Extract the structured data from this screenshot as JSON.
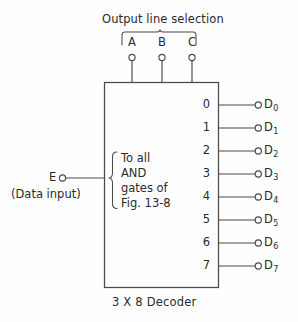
{
  "figure": {
    "caption": "3 X 8 Decoder",
    "top_label": "Output line selection",
    "select_inputs": [
      {
        "label": "A",
        "x": 132
      },
      {
        "label": "B",
        "x": 162
      },
      {
        "label": "C",
        "x": 192
      }
    ],
    "enable_input": {
      "label": "E",
      "sublabel": "(Data input)"
    },
    "inner_note_lines": [
      "To all",
      "AND",
      "gates of",
      "Fig. 13-8"
    ],
    "outputs": [
      {
        "pin": "0",
        "name": "D",
        "sub": "0",
        "y": 105
      },
      {
        "pin": "1",
        "name": "D",
        "sub": "1",
        "y": 128
      },
      {
        "pin": "2",
        "name": "D",
        "sub": "2",
        "y": 151
      },
      {
        "pin": "3",
        "name": "D",
        "sub": "3",
        "y": 174
      },
      {
        "pin": "4",
        "name": "D",
        "sub": "4",
        "y": 197
      },
      {
        "pin": "5",
        "name": "D",
        "sub": "5",
        "y": 220
      },
      {
        "pin": "6",
        "name": "D",
        "sub": "6",
        "y": 243
      },
      {
        "pin": "7",
        "name": "D",
        "sub": "7",
        "y": 266
      }
    ],
    "colors": {
      "line": "#4a4a4a",
      "text": "#2a2a2a",
      "background": "#fefefe"
    }
  }
}
